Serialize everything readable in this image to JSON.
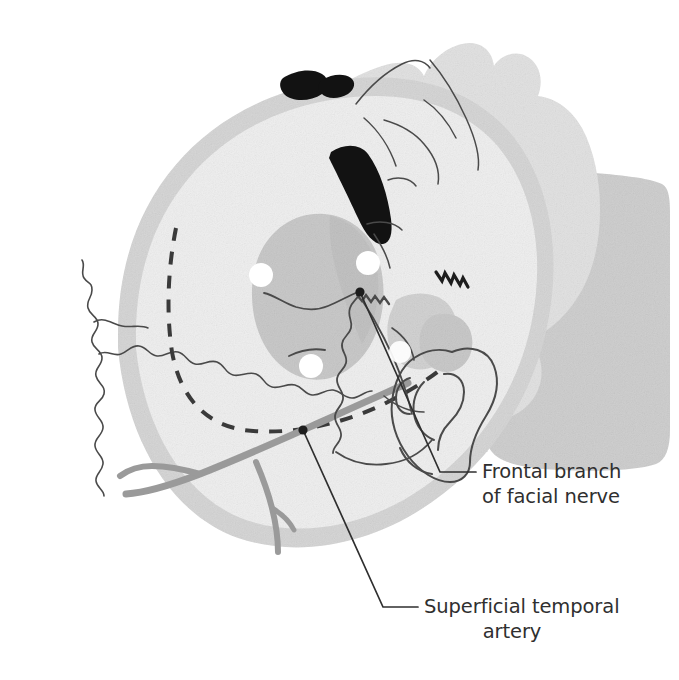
{
  "figure": {
    "background_color": "#ffffff",
    "palette": {
      "skull_rim": "#d6d6d6",
      "skull_interior": "#efefef",
      "face_fill": "#e3e3e3",
      "neck_fill": "#cfcfcf",
      "temporalis_fill": "#c9c9c9",
      "artery_gray": "#9a9a9a",
      "line_dark": "#3a3a3a",
      "marker_white": "#ffffff",
      "eyebrow_black": "#121212",
      "text_color": "#2f2f2f"
    }
  },
  "labels": [
    {
      "id": "frontal-branch",
      "line1": "Frontal branch",
      "line2": "of facial nerve",
      "text_x": 482,
      "text_y": 478,
      "leader_start_x": 360,
      "leader_start_y": 292,
      "leader_elbow_x": 440,
      "leader_elbow_y": 472,
      "leader_end_x": 476,
      "leader_end_y": 472
    },
    {
      "id": "superficial-temporal-artery",
      "line1": "Superficial temporal",
      "line2": "artery",
      "text_x": 424,
      "text_y": 613,
      "leader_start_x": 303,
      "leader_start_y": 430,
      "leader_elbow_x": 383,
      "leader_elbow_y": 607,
      "leader_end_x": 418,
      "leader_end_y": 607
    }
  ],
  "markers": {
    "anchor_dots": [
      {
        "id": "nerve-anchor",
        "cx": 360,
        "cy": 292,
        "r": 4.5
      },
      {
        "id": "artery-anchor",
        "cx": 303,
        "cy": 430,
        "r": 4.5
      }
    ],
    "landmark_dots": [
      {
        "id": "landmark-anterior-temporal",
        "cx": 261,
        "cy": 275,
        "r": 12
      },
      {
        "id": "landmark-supraorbital",
        "cx": 368,
        "cy": 263,
        "r": 12
      },
      {
        "id": "landmark-zygomatic-root",
        "cx": 311,
        "cy": 366,
        "r": 12
      },
      {
        "id": "landmark-preauricular",
        "cx": 400,
        "cy": 352,
        "r": 11
      }
    ]
  },
  "anatomy": {
    "regions": [
      {
        "id": "cranial-vault",
        "name": "cranial vault"
      },
      {
        "id": "temporal-fossa",
        "name": "temporal fossa"
      },
      {
        "id": "face-profile",
        "name": "face profile"
      },
      {
        "id": "neck-shoulder",
        "name": "neck and shoulder"
      },
      {
        "id": "ear",
        "name": "external ear"
      }
    ],
    "lines": [
      {
        "id": "coronal-suture",
        "name": "coronal suture",
        "style": "wavy"
      },
      {
        "id": "squamous-suture",
        "name": "squamous suture",
        "style": "wavy"
      },
      {
        "id": "temporalis-boundary",
        "name": "temporalis muscle boundary",
        "style": "dashed"
      },
      {
        "id": "superficial-temporal-artery-trunk",
        "name": "superficial temporal artery",
        "style": "thick-gray"
      },
      {
        "id": "frontal-branch-nerve",
        "name": "frontal branch of facial nerve",
        "style": "thin-dark"
      }
    ]
  }
}
